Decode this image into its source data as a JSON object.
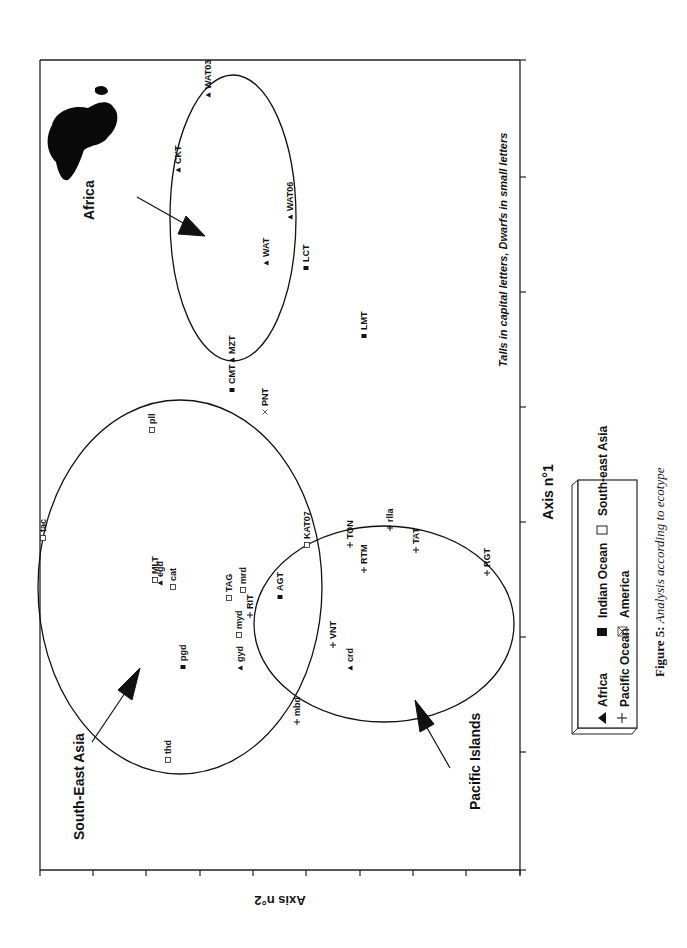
{
  "figure": {
    "caption_bold": "Figure 5:",
    "caption_rest": " Analysis according to ecotype",
    "orientation": "rotated 90° counter-clockwise on page"
  },
  "annotations": {
    "note": "Talls in capital letters, Dwarfs in small letters",
    "africa_label": "Africa",
    "sea_label": "South-East Asia",
    "pacific_label": "Pacific Islands"
  },
  "legend": {
    "items": [
      {
        "symbol": "triangle",
        "label": "Africa"
      },
      {
        "symbol": "filled-square",
        "label": "Indian Ocean"
      },
      {
        "symbol": "open-square",
        "label": "South-east Asia"
      },
      {
        "symbol": "plus",
        "label": "Pacific Ocean"
      },
      {
        "symbol": "crossed-box",
        "label": "America"
      }
    ]
  },
  "chart_data": {
    "type": "scatter",
    "title": "Analysis according to ecotype",
    "xlabel": "Axis n°1",
    "ylabel": "Axis n°2",
    "grid": false,
    "legend_position": "below plot (bottom-right on page)",
    "note": "Talls in capital letters, Dwarfs in small letters",
    "units": "page pixel positions (plot is rotated); axis tick labels are not printed",
    "axis1_ticks_page_y": [
      60,
      177,
      292,
      407,
      522,
      637,
      752,
      870
    ],
    "axis2_ticks_page_x": [
      40,
      93,
      146,
      200,
      253,
      306,
      360,
      413,
      466,
      520
    ],
    "series": [
      {
        "name": "Africa",
        "marker": "triangle",
        "points": [
          {
            "label": "WAT03",
            "x": 208,
            "y": 95
          },
          {
            "label": "CKT",
            "x": 178,
            "y": 170
          },
          {
            "label": "WAT06",
            "x": 290,
            "y": 217
          },
          {
            "label": "WAT",
            "x": 266,
            "y": 263
          },
          {
            "label": "MZT",
            "x": 232,
            "y": 360
          },
          {
            "label": "egd",
            "x": 160,
            "y": 583
          },
          {
            "label": "gyd",
            "x": 240,
            "y": 668
          },
          {
            "label": "crd",
            "x": 350,
            "y": 668
          }
        ]
      },
      {
        "name": "Indian Ocean",
        "marker": "filled-square",
        "points": [
          {
            "label": "LCT",
            "x": 306,
            "y": 268
          },
          {
            "label": "LMT",
            "x": 364,
            "y": 336
          },
          {
            "label": "CMT",
            "x": 232,
            "y": 390
          },
          {
            "label": "AGT",
            "x": 280,
            "y": 597
          },
          {
            "label": "pgd",
            "x": 183,
            "y": 667
          }
        ]
      },
      {
        "name": "South-east Asia",
        "marker": "open-square",
        "points": [
          {
            "label": "pll",
            "x": 152,
            "y": 430
          },
          {
            "label": "tac",
            "x": 43,
            "y": 538
          },
          {
            "label": "KAT07",
            "x": 307,
            "y": 545
          },
          {
            "label": "MLT",
            "x": 155,
            "y": 580
          },
          {
            "label": "cat",
            "x": 173,
            "y": 587
          },
          {
            "label": "TAG",
            "x": 229,
            "y": 598
          },
          {
            "label": "mrd",
            "x": 243,
            "y": 590
          },
          {
            "label": "myd",
            "x": 239,
            "y": 635
          },
          {
            "label": "thd",
            "x": 168,
            "y": 760
          }
        ]
      },
      {
        "name": "Pacific Ocean",
        "marker": "plus",
        "points": [
          {
            "label": "TON",
            "x": 350,
            "y": 545
          },
          {
            "label": "RTM",
            "x": 364,
            "y": 570
          },
          {
            "label": "rlla",
            "x": 390,
            "y": 528
          },
          {
            "label": "TAT",
            "x": 416,
            "y": 550
          },
          {
            "label": "RGT",
            "x": 487,
            "y": 573
          },
          {
            "label": "VNT",
            "x": 333,
            "y": 645
          },
          {
            "label": "RIT",
            "x": 250,
            "y": 615
          },
          {
            "label": "mbd",
            "x": 297,
            "y": 722
          }
        ]
      },
      {
        "name": "America",
        "marker": "crossed-box",
        "points": [
          {
            "label": "PNT",
            "x": 265,
            "y": 412
          }
        ]
      }
    ],
    "groupings": [
      {
        "name": "Africa",
        "shape": "ellipse",
        "cx": 233,
        "cy": 218,
        "rx": 63,
        "ry": 143
      },
      {
        "name": "South-East Asia",
        "shape": "ellipse",
        "cx": 180,
        "cy": 587,
        "rx": 142,
        "ry": 187
      },
      {
        "name": "Pacific Islands",
        "shape": "ellipse",
        "cx": 384,
        "cy": 624,
        "rx": 130,
        "ry": 98
      }
    ]
  }
}
